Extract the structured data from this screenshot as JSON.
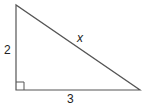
{
  "diagram": {
    "type": "right-triangle",
    "vertices": {
      "top": [
        16,
        5
      ],
      "right_angle": [
        16,
        90
      ],
      "right": [
        140,
        90
      ]
    },
    "labels": {
      "vertical_leg": "2",
      "horizontal_leg": "3",
      "hypotenuse": "x"
    },
    "right_angle_marker": true,
    "stroke_color": "#555555"
  }
}
